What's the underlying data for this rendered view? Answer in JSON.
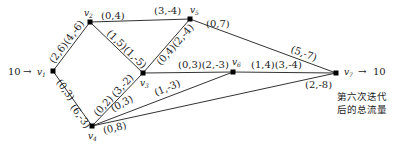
{
  "diagram": {
    "nodes": [
      {
        "id": "v1",
        "label": "v1",
        "sub": "1"
      },
      {
        "id": "v2",
        "label": "v2",
        "sub": "2"
      },
      {
        "id": "v3",
        "label": "v3",
        "sub": "3"
      },
      {
        "id": "v4",
        "label": "v4",
        "sub": "4"
      },
      {
        "id": "v5",
        "label": "v5",
        "sub": "5"
      },
      {
        "id": "v6",
        "label": "v6",
        "sub": "6"
      },
      {
        "id": "v7",
        "label": "v7",
        "sub": "7"
      }
    ],
    "source": {
      "value": "10",
      "arrow": "→"
    },
    "sink": {
      "value": "10",
      "arrow": "→"
    },
    "edges": {
      "v1_v2": "(2,6)(4,-6)",
      "v1_v4": "(0,3)",
      "v4_v1": "(6,-3)",
      "v2_v5": "(3,-4)",
      "v2_v3_top": "(0,4)",
      "v2_v3": "(1,5)(1,-5)",
      "v3_v5": "(0,4)(2,-4)",
      "v3_v6": "(0,3)(2,-3)",
      "v4_v3_a": "(0,2)",
      "v4_v3_b": "(3,-2)",
      "v4_v6_a": "(0,3)",
      "v4_v6_b": "(1,-3)",
      "v4_v7": "(0,8)",
      "v5_v7_a": "(0,7)",
      "v5_v7_b": "(5,-7)",
      "v6_v7": "(1,4)(3,-4)",
      "v7_in": "(2,-8)"
    },
    "caption_line1": "第六次迭代",
    "caption_line2": "后的总流量"
  }
}
